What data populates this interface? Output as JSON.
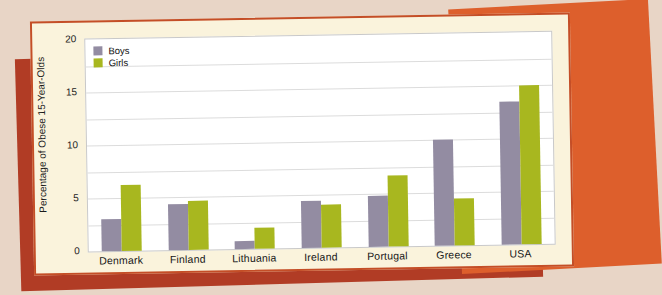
{
  "page": {
    "background_color": "#e8d5c6"
  },
  "decor": {
    "card_background": "#faf3dc",
    "card_border_color": "#c44e27",
    "back_rect_dark_red": "#b13c25",
    "back_rect_orange": "#dd5f2c"
  },
  "chart_data": {
    "type": "bar",
    "title": "",
    "xlabel": "",
    "ylabel": "Percentage of Obese 15-Year-Olds",
    "ylim": [
      0,
      20
    ],
    "yticks": [
      0,
      5,
      10,
      15,
      20
    ],
    "gridline_step": 2.5,
    "grid": true,
    "legend_position": "top-left",
    "plot_background": "#ffffff",
    "gridline_color": "#dcdcdc",
    "categories": [
      "Denmark",
      "Finland",
      "Lithuania",
      "Ireland",
      "Portugal",
      "Greece",
      "USA"
    ],
    "series": [
      {
        "name": "Boys",
        "color": "#938ca2",
        "values": [
          3.0,
          4.3,
          0.8,
          4.4,
          4.8,
          10.0,
          13.5
        ]
      },
      {
        "name": "Girls",
        "color": "#a8b71f",
        "values": [
          6.2,
          4.6,
          2.0,
          4.1,
          6.7,
          4.4,
          15.0
        ]
      }
    ]
  }
}
